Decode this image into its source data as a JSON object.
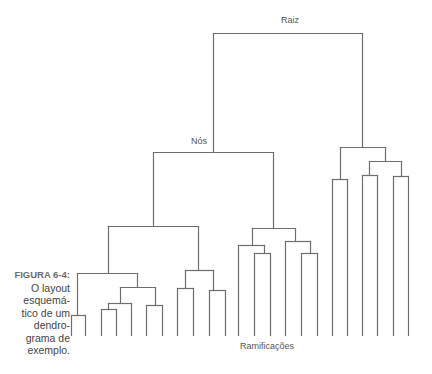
{
  "figure": {
    "number_label": "FIGURA 6-4:",
    "caption_lines": [
      "O layout",
      "esquemá-",
      "tico de um",
      "dendro-",
      "grama de",
      "exemplo."
    ]
  },
  "labels": {
    "root": "Raiz",
    "nodes": "Nós",
    "branches": "Ramificações"
  },
  "colors": {
    "line": "#6e6e6e",
    "text": "#555555"
  },
  "tree": {
    "leaf_count": 22,
    "leaf_baseline_y": 335,
    "segments": [
      [
        213,
        33,
        362,
        33
      ],
      [
        213,
        33,
        213,
        152
      ],
      [
        362,
        33,
        362,
        147
      ],
      [
        153,
        152,
        273,
        152
      ],
      [
        153,
        152,
        153,
        226
      ],
      [
        273,
        152,
        273,
        228
      ],
      [
        108,
        226,
        198,
        226
      ],
      [
        108,
        226,
        108,
        273
      ],
      [
        198,
        226,
        198,
        270
      ],
      [
        77,
        273,
        137,
        273
      ],
      [
        77,
        273,
        77,
        315
      ],
      [
        137,
        273,
        137,
        287
      ],
      [
        71,
        315,
        85,
        315
      ],
      [
        71,
        315,
        71,
        335
      ],
      [
        85,
        315,
        85,
        335
      ],
      [
        120,
        287,
        155,
        287
      ],
      [
        120,
        287,
        120,
        303
      ],
      [
        155,
        287,
        155,
        305
      ],
      [
        108,
        303,
        131,
        303
      ],
      [
        108,
        303,
        108,
        309
      ],
      [
        131,
        303,
        131,
        335
      ],
      [
        101,
        309,
        116,
        309
      ],
      [
        101,
        309,
        101,
        335
      ],
      [
        116,
        309,
        116,
        335
      ],
      [
        146,
        305,
        162,
        305
      ],
      [
        146,
        305,
        146,
        335
      ],
      [
        162,
        305,
        162,
        335
      ],
      [
        185,
        270,
        213,
        270
      ],
      [
        185,
        270,
        185,
        288
      ],
      [
        213,
        270,
        213,
        290
      ],
      [
        177,
        288,
        193,
        288
      ],
      [
        177,
        288,
        177,
        335
      ],
      [
        193,
        288,
        193,
        335
      ],
      [
        209,
        290,
        225,
        290
      ],
      [
        209,
        290,
        209,
        335
      ],
      [
        225,
        290,
        225,
        335
      ],
      [
        252,
        228,
        295,
        228
      ],
      [
        252,
        228,
        252,
        245
      ],
      [
        295,
        228,
        295,
        241
      ],
      [
        238,
        245,
        264,
        245
      ],
      [
        238,
        245,
        238,
        335
      ],
      [
        264,
        245,
        264,
        253
      ],
      [
        254,
        253,
        270,
        253
      ],
      [
        254,
        253,
        254,
        335
      ],
      [
        270,
        253,
        270,
        335
      ],
      [
        285,
        241,
        310,
        241
      ],
      [
        285,
        241,
        285,
        335
      ],
      [
        310,
        241,
        310,
        253
      ],
      [
        301,
        253,
        317,
        253
      ],
      [
        301,
        253,
        301,
        335
      ],
      [
        317,
        253,
        317,
        335
      ],
      [
        340,
        147,
        385,
        147
      ],
      [
        340,
        147,
        340,
        179
      ],
      [
        385,
        147,
        385,
        161
      ],
      [
        332,
        179,
        347,
        179
      ],
      [
        332,
        179,
        332,
        335
      ],
      [
        347,
        179,
        347,
        335
      ],
      [
        369,
        161,
        401,
        161
      ],
      [
        369,
        161,
        369,
        175
      ],
      [
        401,
        161,
        401,
        176
      ],
      [
        362,
        175,
        377,
        175
      ],
      [
        362,
        175,
        362,
        335
      ],
      [
        377,
        175,
        377,
        335
      ],
      [
        393,
        176,
        408,
        176
      ],
      [
        393,
        176,
        393,
        335
      ],
      [
        408,
        176,
        408,
        335
      ]
    ]
  }
}
